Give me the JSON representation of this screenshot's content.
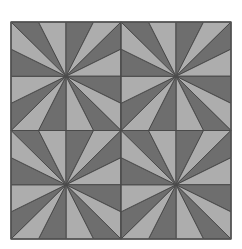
{
  "figure": {
    "canvas": {
      "width": 242,
      "height": 249,
      "background": "#ffffff"
    },
    "bounds": {
      "x": 11,
      "y": 22,
      "width": 220,
      "height": 217
    },
    "grid": {
      "columns": 2,
      "rows": 2,
      "tile_width": 110,
      "tile_height": 108.5
    },
    "colors": {
      "dark_fill": "#6e6e6e",
      "light_fill": "#adadad",
      "stroke": "#4a4a4a",
      "outer_border": "#555555",
      "page_background": "#ffffff"
    },
    "stroke_width": 1,
    "triangles_per_tile": 8,
    "total_triangles": 32,
    "tile_geometry": {
      "center": [
        0.5,
        0.5
      ],
      "edge_vertices_fraction": [
        0.25,
        0.75
      ],
      "wedge_fills": [
        "dark",
        "light",
        "dark",
        "light",
        "dark",
        "light",
        "dark",
        "light"
      ],
      "wedges": [
        {
          "index": 0,
          "edge": "top",
          "points": [
            [
              0.5,
              0.5
            ],
            [
              0.0,
              0.0
            ],
            [
              0.25,
              0.0
            ]
          ],
          "fill": "dark"
        },
        {
          "index": 1,
          "edge": "top",
          "points": [
            [
              0.5,
              0.5
            ],
            [
              0.25,
              0.0
            ],
            [
              0.5,
              0.0
            ]
          ],
          "fill": "light"
        },
        {
          "index": 2,
          "edge": "top",
          "points": [
            [
              0.5,
              0.5
            ],
            [
              0.5,
              0.0
            ],
            [
              0.75,
              0.0
            ]
          ],
          "fill": "dark"
        },
        {
          "index": 3,
          "edge": "top",
          "points": [
            [
              0.5,
              0.5
            ],
            [
              0.75,
              0.0
            ],
            [
              1.0,
              0.0
            ]
          ],
          "fill": "light"
        },
        {
          "index": 4,
          "edge": "right",
          "points": [
            [
              0.5,
              0.5
            ],
            [
              1.0,
              0.0
            ],
            [
              1.0,
              0.25
            ]
          ],
          "fill": "dark"
        },
        {
          "index": 5,
          "edge": "right",
          "points": [
            [
              0.5,
              0.5
            ],
            [
              1.0,
              0.25
            ],
            [
              1.0,
              0.5
            ]
          ],
          "fill": "light"
        },
        {
          "index": 6,
          "edge": "right",
          "points": [
            [
              0.5,
              0.5
            ],
            [
              1.0,
              0.5
            ],
            [
              1.0,
              0.75
            ]
          ],
          "fill": "dark"
        },
        {
          "index": 7,
          "edge": "right",
          "points": [
            [
              0.5,
              0.5
            ],
            [
              1.0,
              0.75
            ],
            [
              1.0,
              1.0
            ]
          ],
          "fill": "light"
        },
        {
          "index": 8,
          "edge": "bottom",
          "points": [
            [
              0.5,
              0.5
            ],
            [
              1.0,
              1.0
            ],
            [
              0.75,
              1.0
            ]
          ],
          "fill": "dark"
        },
        {
          "index": 9,
          "edge": "bottom",
          "points": [
            [
              0.5,
              0.5
            ],
            [
              0.75,
              1.0
            ],
            [
              0.5,
              1.0
            ]
          ],
          "fill": "light"
        },
        {
          "index": 10,
          "edge": "bottom",
          "points": [
            [
              0.5,
              0.5
            ],
            [
              0.5,
              1.0
            ],
            [
              0.25,
              1.0
            ]
          ],
          "fill": "dark"
        },
        {
          "index": 11,
          "edge": "bottom",
          "points": [
            [
              0.5,
              0.5
            ],
            [
              0.25,
              1.0
            ],
            [
              0.0,
              1.0
            ]
          ],
          "fill": "light"
        },
        {
          "index": 12,
          "edge": "left",
          "points": [
            [
              0.5,
              0.5
            ],
            [
              0.0,
              1.0
            ],
            [
              0.0,
              0.75
            ]
          ],
          "fill": "dark"
        },
        {
          "index": 13,
          "edge": "left",
          "points": [
            [
              0.5,
              0.5
            ],
            [
              0.0,
              0.75
            ],
            [
              0.0,
              0.5
            ]
          ],
          "fill": "light"
        },
        {
          "index": 14,
          "edge": "left",
          "points": [
            [
              0.5,
              0.5
            ],
            [
              0.0,
              0.5
            ],
            [
              0.0,
              0.25
            ]
          ],
          "fill": "dark"
        },
        {
          "index": 15,
          "edge": "left",
          "points": [
            [
              0.5,
              0.5
            ],
            [
              0.0,
              0.25
            ],
            [
              0.0,
              0.0
            ]
          ],
          "fill": "light"
        }
      ]
    },
    "tiles": [
      {
        "id": "tile-top-left",
        "row": 0,
        "col": 0,
        "x": 11,
        "y": 22
      },
      {
        "id": "tile-top-right",
        "row": 0,
        "col": 1,
        "x": 121,
        "y": 22
      },
      {
        "id": "tile-bottom-left",
        "row": 1,
        "col": 0,
        "x": 11,
        "y": 130.5
      },
      {
        "id": "tile-bottom-right",
        "row": 1,
        "col": 1,
        "x": 121,
        "y": 130.5
      }
    ]
  }
}
